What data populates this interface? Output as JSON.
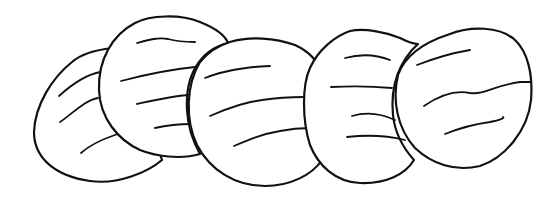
{
  "illustration": {
    "subject": "five overlapping round line-drawn shapes",
    "count": 5,
    "colors": {
      "line": "#111111",
      "fill": "#ffffff",
      "background": "#ffffff"
    }
  }
}
